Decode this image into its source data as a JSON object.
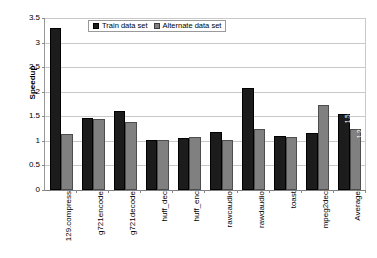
{
  "chart_data": {
    "type": "bar",
    "title": "",
    "xlabel": "",
    "ylabel": "Speedup",
    "ylim": [
      0,
      3.5
    ],
    "ytick_step": 0.5,
    "yticks": [
      "3.5",
      "3",
      "2.5",
      "2",
      "1.5",
      "1",
      "0.5",
      "0"
    ],
    "grid": true,
    "legend_position": "top-center",
    "categories": [
      "129.compress",
      "g721encode",
      "g721decode",
      "huff_dec",
      "huff_enc",
      "rawcaudio",
      "rawdaudio",
      "toast",
      "mpeg2dec",
      "Average"
    ],
    "series": [
      {
        "name": "Train data set",
        "color": "#1c1c1c",
        "values": [
          3.29,
          1.47,
          1.6,
          1.01,
          1.06,
          1.19,
          2.07,
          1.1,
          1.17,
          1.54
        ]
      },
      {
        "name": "Alternate data set",
        "color": "#808080",
        "values": [
          1.14,
          1.44,
          1.39,
          1.01,
          1.07,
          1.01,
          1.25,
          1.08,
          1.74,
          1.25
        ]
      }
    ],
    "data_labels": [
      {
        "category": "Average",
        "series": "Train data set",
        "text": "1.54"
      },
      {
        "category": "Average",
        "series": "Alternate data set",
        "text": "1.25"
      }
    ]
  },
  "legend": {
    "entries": [
      {
        "label": "Train data set"
      },
      {
        "label": "Alternate data set"
      }
    ]
  },
  "axis": {
    "y_title": "Speedup"
  }
}
